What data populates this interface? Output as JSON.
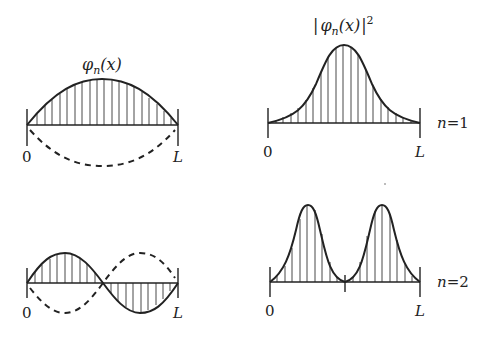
{
  "panels": [
    {
      "id": "n1-wavefunction",
      "label": "φn(x)",
      "row": "n=1",
      "kind": "wavefunction",
      "x_start_label": "0",
      "x_end_label": "L"
    },
    {
      "id": "n1-probability",
      "label": "|φn(x)|²",
      "row": "n=1",
      "kind": "probability-density",
      "x_start_label": "0",
      "x_end_label": "L"
    },
    {
      "id": "n2-wavefunction",
      "label": "",
      "row": "n=2",
      "kind": "wavefunction",
      "x_start_label": "0",
      "x_end_label": "L"
    },
    {
      "id": "n2-probability",
      "label": "",
      "row": "n=2",
      "kind": "probability-density",
      "x_start_label": "0",
      "x_end_label": "L"
    }
  ],
  "labels": {
    "phi": "φ",
    "phi_sub": "n",
    "phi_arg": "(x)",
    "abs_bar": "|",
    "sq": "2",
    "zero": "0",
    "L": "L",
    "n1_var": "n",
    "n1_eq": "=1",
    "n2_var": "n",
    "n2_eq": "=2"
  },
  "colors": {
    "ink": "#222222",
    "hatch": "#333333",
    "background": "#ffffff"
  }
}
